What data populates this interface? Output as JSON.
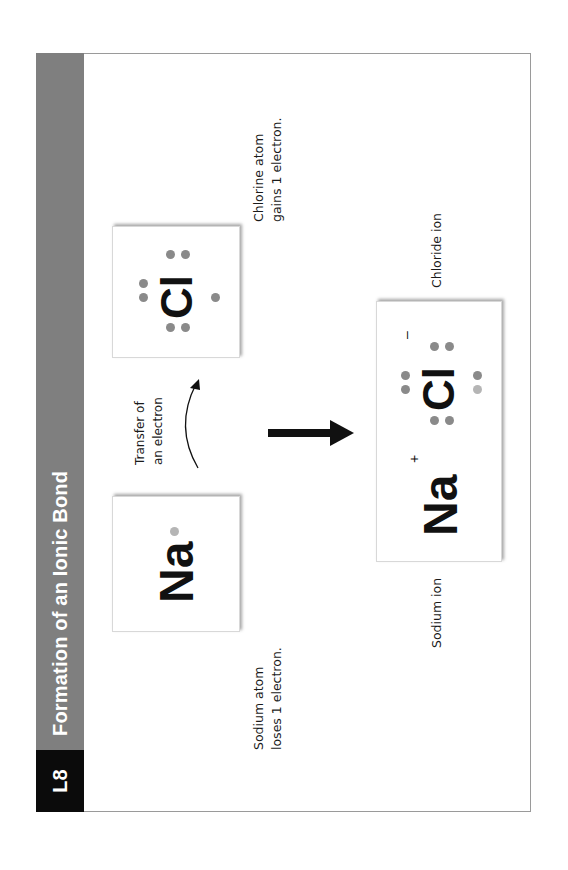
{
  "page": {
    "orientation": "rotated-90-ccw",
    "lesson_code": "L8",
    "title": "Formation of an Ionic Bond",
    "colors": {
      "header_band": "#7f7f7f",
      "lesson_badge": "#0b0b0b",
      "frame_border": "#9a9a9a",
      "electron_dot": "#8a8a8a",
      "transferred_electron_dot": "#b5b5b5"
    }
  },
  "diagram": {
    "sodium_atom": {
      "symbol": "Na",
      "valence_electrons": 1,
      "caption_line1": "Sodium atom",
      "caption_line2": "loses 1 electron."
    },
    "chlorine_atom": {
      "symbol": "Cl",
      "valence_electrons": 7,
      "caption_line1": "Chlorine atom",
      "caption_line2": "gains 1 electron."
    },
    "transfer": {
      "label_line1": "Transfer of",
      "label_line2": "an electron",
      "icon": "curved-arrow-icon"
    },
    "reaction_arrow": {
      "icon": "right-arrow-icon"
    },
    "product": {
      "sodium_ion": {
        "symbol": "Na",
        "charge": "+",
        "caption": "Sodium ion"
      },
      "chloride_ion": {
        "symbol": "Cl",
        "charge": "–",
        "valence_electrons": 8,
        "caption": "Chloride ion"
      }
    }
  }
}
